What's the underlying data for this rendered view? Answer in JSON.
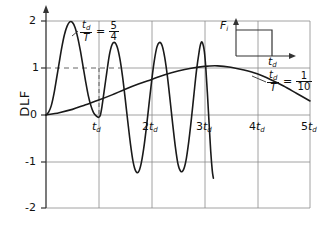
{
  "chart_data": {
    "type": "line",
    "title": "",
    "xlabel": "",
    "ylabel": "DLF",
    "xlim": [
      0,
      5
    ],
    "ylim": [
      -2,
      2
    ],
    "x_tick_labels": [
      "t_d",
      "2t_d",
      "3t_d",
      "4t_d",
      "5t_d"
    ],
    "x_tick_values": [
      1,
      2,
      3,
      4,
      5
    ],
    "y_tick_labels": [
      "2",
      "1",
      "0",
      "-1",
      "-2"
    ],
    "y_tick_values": [
      2,
      1,
      0,
      -1,
      -2
    ],
    "grid": true,
    "legend_position": "inline-annotations",
    "series": [
      {
        "name": "td/T = 5/4",
        "label": "t_d/T = 5/4",
        "description": "Lightly damped oscillatory response, first peak near 2.0, truncated at 3t_d",
        "points": [
          [
            0.0,
            0.0
          ],
          [
            0.05,
            0.06
          ],
          [
            0.1,
            0.2
          ],
          [
            0.15,
            0.45
          ],
          [
            0.2,
            0.78
          ],
          [
            0.25,
            1.12
          ],
          [
            0.3,
            1.45
          ],
          [
            0.35,
            1.72
          ],
          [
            0.4,
            1.9
          ],
          [
            0.45,
            1.99
          ],
          [
            0.5,
            1.98
          ],
          [
            0.55,
            1.87
          ],
          [
            0.6,
            1.66
          ],
          [
            0.65,
            1.38
          ],
          [
            0.7,
            1.05
          ],
          [
            0.75,
            0.72
          ],
          [
            0.8,
            0.42
          ],
          [
            0.85,
            0.2
          ],
          [
            0.9,
            0.05
          ],
          [
            0.95,
            -0.02
          ],
          [
            1.0,
            -0.05
          ],
          [
            1.03,
            0.0
          ],
          [
            1.06,
            0.18
          ],
          [
            1.1,
            0.5
          ],
          [
            1.15,
            0.9
          ],
          [
            1.2,
            1.28
          ],
          [
            1.25,
            1.5
          ],
          [
            1.3,
            1.55
          ],
          [
            1.35,
            1.45
          ],
          [
            1.4,
            1.2
          ],
          [
            1.45,
            0.82
          ],
          [
            1.5,
            0.35
          ],
          [
            1.55,
            -0.15
          ],
          [
            1.6,
            -0.62
          ],
          [
            1.65,
            -1.0
          ],
          [
            1.7,
            -1.2
          ],
          [
            1.75,
            -1.22
          ],
          [
            1.8,
            -1.05
          ],
          [
            1.85,
            -0.72
          ],
          [
            1.9,
            -0.28
          ],
          [
            1.95,
            0.22
          ],
          [
            2.0,
            0.72
          ],
          [
            2.05,
            1.15
          ],
          [
            2.1,
            1.45
          ],
          [
            2.15,
            1.55
          ],
          [
            2.2,
            1.48
          ],
          [
            2.25,
            1.22
          ],
          [
            2.3,
            0.82
          ],
          [
            2.35,
            0.32
          ],
          [
            2.4,
            -0.2
          ],
          [
            2.45,
            -0.68
          ],
          [
            2.5,
            -1.05
          ],
          [
            2.55,
            -1.2
          ],
          [
            2.6,
            -1.18
          ],
          [
            2.65,
            -0.98
          ],
          [
            2.7,
            -0.6
          ],
          [
            2.75,
            -0.12
          ],
          [
            2.8,
            0.42
          ],
          [
            2.85,
            0.95
          ],
          [
            2.9,
            1.35
          ],
          [
            2.93,
            1.52
          ],
          [
            2.96,
            1.55
          ],
          [
            3.0,
            1.35
          ],
          [
            3.03,
            0.95
          ],
          [
            3.06,
            0.4
          ],
          [
            3.09,
            -0.2
          ],
          [
            3.12,
            -0.78
          ],
          [
            3.15,
            -1.2
          ],
          [
            3.17,
            -1.35
          ]
        ]
      },
      {
        "name": "td/T = 1/10",
        "label": "t_d/T = 1/10",
        "description": "Slowly rising quasi-static response, broad maximum about 1.05 near 3t_d, then decaying",
        "points": [
          [
            0.0,
            0.0
          ],
          [
            0.25,
            0.05
          ],
          [
            0.5,
            0.12
          ],
          [
            0.75,
            0.22
          ],
          [
            1.0,
            0.32
          ],
          [
            1.25,
            0.43
          ],
          [
            1.5,
            0.55
          ],
          [
            1.75,
            0.66
          ],
          [
            2.0,
            0.76
          ],
          [
            2.25,
            0.86
          ],
          [
            2.5,
            0.94
          ],
          [
            2.75,
            1.0
          ],
          [
            3.0,
            1.04
          ],
          [
            3.25,
            1.05
          ],
          [
            3.5,
            1.02
          ],
          [
            3.75,
            0.96
          ],
          [
            4.0,
            0.88
          ],
          [
            4.25,
            0.76
          ],
          [
            4.5,
            0.62
          ],
          [
            4.75,
            0.46
          ],
          [
            5.0,
            0.3
          ]
        ]
      }
    ],
    "annotations": [
      {
        "id": "label-5-4",
        "text": "t_d/T = 5/4",
        "x": 0.9,
        "y": 1.75
      },
      {
        "id": "label-1-10",
        "text": "t_d/T = 1/10",
        "x": 3.6,
        "y": 0.9
      }
    ],
    "inset": {
      "name": "force-pulse-inset",
      "type": "rectangular-pulse",
      "y_axis_label": "F",
      "y_axis_sub": "i",
      "x_axis_label": "t",
      "x_axis_sub": "d"
    }
  },
  "labels": {
    "y_axis_title": "DLF",
    "y_ticks": [
      "2",
      "1",
      "0",
      "-1",
      "-2"
    ],
    "x_ticks": [
      {
        "base": "t",
        "sub": "d",
        "prefix": ""
      },
      {
        "base": "t",
        "sub": "d",
        "prefix": "2"
      },
      {
        "base": "t",
        "sub": "d",
        "prefix": "3"
      },
      {
        "base": "t",
        "sub": "d",
        "prefix": "4"
      },
      {
        "base": "t",
        "sub": "d",
        "prefix": "5"
      }
    ],
    "annot_a": {
      "var_num": "t",
      "var_num_sub": "d",
      "var_den": "T",
      "eq": "=",
      "frac_num": "5",
      "frac_den": "4"
    },
    "annot_b": {
      "var_num": "t",
      "var_num_sub": "d",
      "var_den": "T",
      "eq": "=",
      "frac_num": "1",
      "frac_den": "10"
    },
    "inset_y": "F",
    "inset_y_sub": "i",
    "inset_x": "t",
    "inset_x_sub": "d"
  },
  "colors": {
    "curve": "#1a1a1a",
    "grid": "#8a8a8a",
    "axis": "#333333",
    "background": "#ffffff"
  }
}
